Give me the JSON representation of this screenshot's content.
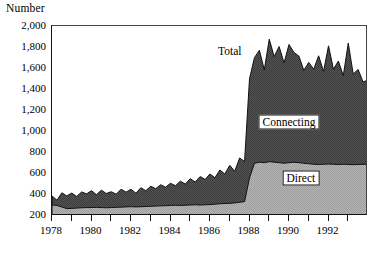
{
  "chart_data": {
    "type": "area",
    "stacked": true,
    "title": "",
    "subtitle": "",
    "ylabel": "Number",
    "xlabel": "",
    "ylim": [
      200,
      2000
    ],
    "xlim": [
      1978,
      1994
    ],
    "grid": false,
    "legend_position": "in-plot annotations",
    "ytick_labels": [
      "2,000",
      "1,800",
      "1,600",
      "1,400",
      "1,200",
      "1,000",
      "800",
      "600",
      "400",
      "200"
    ],
    "ytick_values": [
      2000,
      1800,
      1600,
      1400,
      1200,
      1000,
      800,
      600,
      400,
      200
    ],
    "xtick_labels": [
      "1978",
      "1980",
      "1982",
      "1984",
      "1986",
      "1988",
      "1990",
      "1992"
    ],
    "xtick_values": [
      1978,
      1980,
      1982,
      1984,
      1986,
      1988,
      1990,
      1992
    ],
    "xminor_ticks": [
      1979,
      1981,
      1983,
      1985,
      1987,
      1989,
      1991,
      1993,
      1994
    ],
    "annotations": [
      {
        "text": "Total",
        "x": 1987.0,
        "y": 1760,
        "boxed": false
      },
      {
        "text": "Connecting",
        "x": 1990.0,
        "y": 1090,
        "boxed": true
      },
      {
        "text": "Direct",
        "x": 1990.6,
        "y": 560,
        "boxed": true
      }
    ],
    "colors": {
      "direct_fill": "#a8a8a8",
      "connecting_fill": "#4a4a4a",
      "outline": "#111111",
      "background": "#ffffff",
      "axis": "#111111"
    },
    "series": [
      {
        "name": "Direct",
        "fill": "#a8a8a8",
        "x": [
          1978.0,
          1978.25,
          1978.5,
          1978.75,
          1979.0,
          1979.25,
          1979.5,
          1979.75,
          1980.0,
          1980.25,
          1980.5,
          1980.75,
          1981.0,
          1981.25,
          1981.5,
          1981.75,
          1982.0,
          1982.25,
          1982.5,
          1982.75,
          1983.0,
          1983.25,
          1983.5,
          1983.75,
          1984.0,
          1984.25,
          1984.5,
          1984.75,
          1985.0,
          1985.25,
          1985.5,
          1985.75,
          1986.0,
          1986.25,
          1986.5,
          1986.75,
          1987.0,
          1987.25,
          1987.5,
          1987.75,
          1988.0,
          1988.25,
          1988.5,
          1988.75,
          1989.0,
          1989.25,
          1989.5,
          1989.75,
          1990.0,
          1990.25,
          1990.5,
          1990.75,
          1991.0,
          1991.25,
          1991.5,
          1991.75,
          1992.0,
          1992.25,
          1992.5,
          1992.75,
          1993.0,
          1993.25,
          1993.5,
          1993.75,
          1994.0
        ],
        "values": [
          305,
          300,
          285,
          270,
          272,
          275,
          278,
          280,
          280,
          282,
          280,
          278,
          280,
          282,
          284,
          286,
          288,
          286,
          288,
          290,
          292,
          294,
          296,
          298,
          300,
          302,
          300,
          302,
          304,
          306,
          304,
          306,
          308,
          312,
          316,
          318,
          320,
          324,
          330,
          336,
          560,
          700,
          710,
          705,
          715,
          710,
          705,
          700,
          705,
          710,
          705,
          700,
          695,
          690,
          688,
          690,
          692,
          690,
          688,
          690,
          688,
          686,
          688,
          690,
          688
        ]
      },
      {
        "name": "Connecting",
        "fill": "#4a4a4a",
        "x": [
          1978.0,
          1978.25,
          1978.5,
          1978.75,
          1979.0,
          1979.25,
          1979.5,
          1979.75,
          1980.0,
          1980.25,
          1980.5,
          1980.75,
          1981.0,
          1981.25,
          1981.5,
          1981.75,
          1982.0,
          1982.25,
          1982.5,
          1982.75,
          1983.0,
          1983.25,
          1983.5,
          1983.75,
          1984.0,
          1984.25,
          1984.5,
          1984.75,
          1985.0,
          1985.25,
          1985.5,
          1985.75,
          1986.0,
          1986.25,
          1986.5,
          1986.75,
          1987.0,
          1987.25,
          1987.5,
          1987.75,
          1988.0,
          1988.25,
          1988.5,
          1988.75,
          1989.0,
          1989.25,
          1989.5,
          1989.75,
          1990.0,
          1990.25,
          1990.5,
          1990.75,
          1991.0,
          1991.25,
          1991.5,
          1991.75,
          1992.0,
          1992.25,
          1992.5,
          1992.75,
          1993.0,
          1993.25,
          1993.5,
          1993.75,
          1994.0
        ],
        "values": [
          85,
          50,
          135,
          120,
          145,
          110,
          150,
          130,
          160,
          120,
          165,
          135,
          150,
          125,
          170,
          140,
          165,
          130,
          180,
          150,
          190,
          165,
          200,
          175,
          210,
          185,
          230,
          200,
          250,
          215,
          270,
          240,
          290,
          250,
          320,
          280,
          360,
          300,
          420,
          380,
          940,
          1000,
          1060,
          880,
          1160,
          1000,
          1100,
          950,
          1120,
          1040,
          1010,
          880,
          960,
          900,
          1030,
          880,
          1120,
          900,
          980,
          840,
          1150,
          860,
          900,
          780,
          800
        ]
      },
      {
        "name": "Total",
        "note": "top of stacked area = Direct + Connecting",
        "fill": "none",
        "x": [
          1978.0,
          1979.0,
          1980.0,
          1981.0,
          1982.0,
          1983.0,
          1984.0,
          1985.0,
          1986.0,
          1987.0,
          1988.0,
          1989.0,
          1990.0,
          1991.0,
          1992.0,
          1993.0,
          1994.0
        ],
        "values": [
          390,
          417,
          440,
          430,
          453,
          482,
          510,
          554,
          598,
          680,
          1500,
          1875,
          1825,
          1655,
          1812,
          1838,
          1488
        ]
      }
    ]
  }
}
